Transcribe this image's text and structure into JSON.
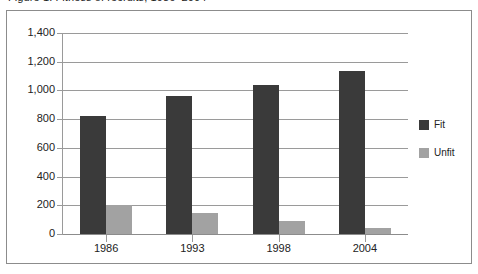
{
  "title": {
    "text": "Figure 1. Fitness of recruits, 1986–2004",
    "visible_partially": true
  },
  "legend": {
    "position": "right",
    "items": [
      {
        "label": "Fit",
        "color": "#3a3a3a",
        "swatch": "legend-swatch-fit"
      },
      {
        "label": "Unfit",
        "color": "#a2a2a2",
        "swatch": "legend-swatch-unfit"
      }
    ]
  },
  "axes": {
    "y_tick_labels": [
      "1,400",
      "1,200",
      "1,000",
      "800",
      "600",
      "400",
      "200",
      "0"
    ],
    "x_tick_labels": [
      "1986",
      "1993",
      "1998",
      "2004"
    ]
  },
  "colors": {
    "fit": "#3a3a3a",
    "unfit": "#a2a2a2",
    "gridline": "#9a9a9a",
    "frame": "#8c8c8c",
    "background": "#ffffff",
    "text": "#222222"
  },
  "chart_data": {
    "type": "bar",
    "title": "Figure 1. Fitness of recruits, 1986–2004",
    "xlabel": "",
    "ylabel": "",
    "categories": [
      "1986",
      "1993",
      "1998",
      "2004"
    ],
    "series": [
      {
        "name": "Fit",
        "values": [
          820,
          960,
          1040,
          1135
        ]
      },
      {
        "name": "Unfit",
        "values": [
          200,
          145,
          90,
          45
        ]
      }
    ],
    "ylim": [
      0,
      1400
    ],
    "ytick_values": [
      0,
      200,
      400,
      600,
      800,
      1000,
      1200,
      1400
    ],
    "ytick_labels": [
      "0",
      "200",
      "400",
      "600",
      "800",
      "1,000",
      "1,200",
      "1,400"
    ],
    "grid": true,
    "grid_axis": "y",
    "legend_position": "right",
    "bar_group_mode": "grouped"
  }
}
